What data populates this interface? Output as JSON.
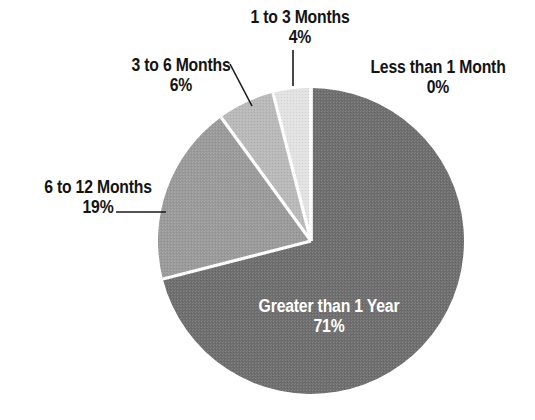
{
  "chart_data": {
    "type": "pie",
    "title": "",
    "subtitle": "",
    "xlabel": "",
    "ylabel": "",
    "legend_position": "none",
    "grid": false,
    "labels_on_slices": true,
    "value_unit": "%",
    "categories": [
      "Less than 1 Month",
      "1 to 3 Months",
      "3 to 6 Months",
      "6 to 12 Months",
      "Greater than 1 Year"
    ],
    "values": [
      0,
      4,
      6,
      19,
      71
    ],
    "value_labels": [
      "0%",
      "4%",
      "6%",
      "19%",
      "71%"
    ],
    "colors": [
      "#e2e2e2",
      "#e2e2e2",
      "#b9b9b9",
      "#9a9a9a",
      "#6e6e6e"
    ],
    "slices": [
      {
        "name": "Less than 1 Month",
        "value": 0,
        "value_label": "0%",
        "color": "#e2e2e2",
        "label_placement": "outside-right",
        "label_text_color": "#141414",
        "leader": "none"
      },
      {
        "name": "1 to 3 Months",
        "value": 4,
        "value_label": "4%",
        "color": "#e2e2e2",
        "label_placement": "outside-top",
        "label_text_color": "#141414",
        "leader": "vertical"
      },
      {
        "name": "3 to 6 Months",
        "value": 6,
        "value_label": "6%",
        "color": "#b9b9b9",
        "label_placement": "outside-top-left",
        "label_text_color": "#141414",
        "leader": "diagonal"
      },
      {
        "name": "6 to 12 Months",
        "value": 19,
        "value_label": "19%",
        "color": "#9a9a9a",
        "label_placement": "outside-left",
        "label_text_color": "#141414",
        "leader": "horizontal"
      },
      {
        "name": "Greater than 1 Year",
        "value": 71,
        "value_label": "71%",
        "color": "#6e6e6e",
        "label_placement": "inside",
        "label_text_color": "#ffffff",
        "leader": "none"
      }
    ]
  },
  "geometry": {
    "center_x": 311,
    "center_y": 241,
    "radius": 153,
    "start_angle_deg": 0,
    "direction": "clockwise",
    "separator_color": "#ffffff",
    "background": "#ffffff"
  },
  "labels": {
    "less_than_1_month": {
      "name": "Less than 1 Month",
      "pct": "0%"
    },
    "one_to_three": {
      "name": "1 to 3 Months",
      "pct": "4%"
    },
    "three_to_six": {
      "name": "3 to 6 Months",
      "pct": "6%"
    },
    "six_to_twelve": {
      "name": "6 to 12 Months",
      "pct": "19%"
    },
    "greater_than_1_year": {
      "name": "Greater than 1 Year",
      "pct": "71%"
    }
  }
}
